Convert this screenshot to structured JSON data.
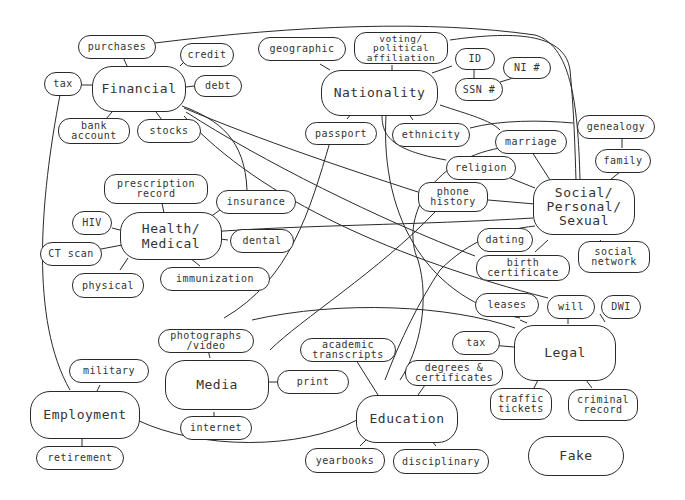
{
  "diagram": {
    "hubs": [
      {
        "id": "financial",
        "label": "Financial"
      },
      {
        "id": "nationality",
        "label": "Nationality"
      },
      {
        "id": "health",
        "label": "Health/\nMedical"
      },
      {
        "id": "social",
        "label": "Social/\nPersonal/\nSexual"
      },
      {
        "id": "media",
        "label": "Media"
      },
      {
        "id": "legal",
        "label": "Legal"
      },
      {
        "id": "employment",
        "label": "Employment"
      },
      {
        "id": "education",
        "label": "Education"
      },
      {
        "id": "fake",
        "label": "Fake"
      }
    ],
    "leaves": {
      "purchases": "purchases",
      "credit": "credit",
      "tax_fin": "tax",
      "debt": "debt",
      "bank_account": "bank\naccount",
      "stocks": "stocks",
      "geographic": "geographic",
      "voting": "voting/\npolitical\naffiliation",
      "id": "ID",
      "ni": "NI #",
      "ssn": "SSN #",
      "passport": "passport",
      "ethnicity": "ethnicity",
      "marriage": "marriage",
      "genealogy": "genealogy",
      "family": "family",
      "religion": "religion",
      "phone_history": "phone\nhistory",
      "dating": "dating",
      "birth_certificate": "birth\ncertificate",
      "social_network": "social\nnetwork",
      "prescription_record": "prescription\nrecord",
      "insurance": "insurance",
      "hiv": "HIV",
      "ct_scan": "CT scan",
      "dental": "dental",
      "physical": "physical",
      "immunization": "immunization",
      "leases": "leases",
      "will": "will",
      "dwi": "DWI",
      "tax_legal": "tax",
      "traffic_tickets": "traffic\ntickets",
      "criminal_record": "criminal\nrecord",
      "photographs_video": "photographs\n/video",
      "academic_transcripts": "academic\ntranscripts",
      "degrees_certificates": "degrees &\ncertificates",
      "print": "print",
      "internet": "internet",
      "military": "military",
      "retirement": "retirement",
      "yearbooks": "yearbooks",
      "disciplinary": "disciplinary"
    }
  }
}
